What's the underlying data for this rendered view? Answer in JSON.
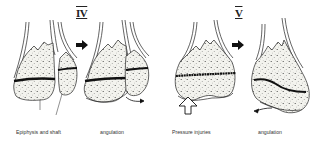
{
  "figure": {
    "type": "medical-diagram"
  },
  "panels": [
    {
      "numeral": "IV",
      "before": {
        "label_line1": "Epiphysis and shaft",
        "label_line2": "split"
      },
      "after": {
        "label_line1": "angulation",
        "label_line2": "later"
      }
    },
    {
      "numeral": "V",
      "before": {
        "label_line1": "Pressure injuries",
        "label_line2": "the epiphyseal plate."
      },
      "after": {
        "label_line1": "angulation",
        "label_line2": "later"
      }
    }
  ],
  "icons": {
    "progression_arrow": "right-arrow-icon",
    "pressure_arrow": "hollow-up-arrow-icon",
    "angulation_arrow": "curved-arrow-icon"
  },
  "colors": {
    "ink": "#222222",
    "bone_fill": "#f1f1ec",
    "growth_plate": "#1a1a1a",
    "background": "#ffffff"
  }
}
